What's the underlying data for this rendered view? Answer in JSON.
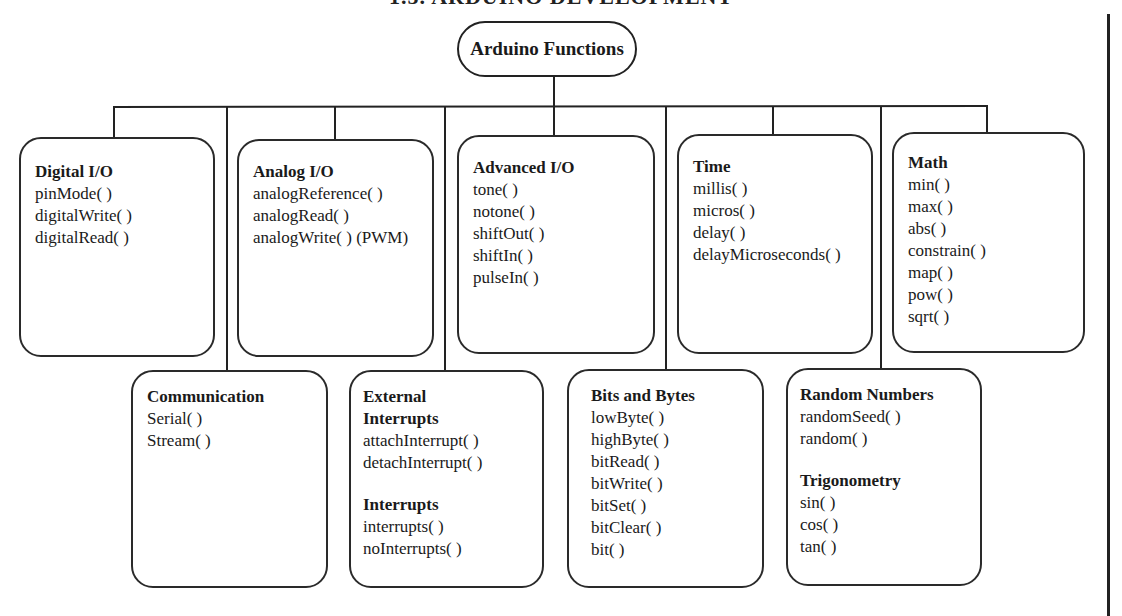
{
  "page": {
    "heading": "1.5. ARDUINO DEVELOPMENT"
  },
  "root": {
    "label": "Arduino Functions"
  },
  "groups": {
    "digital_io": {
      "title": "Digital I/O",
      "functions": [
        "pinMode( )",
        "digitalWrite( )",
        "digitalRead( )"
      ]
    },
    "analog_io": {
      "title": "Analog I/O",
      "functions": [
        "analogReference( )",
        "analogRead( )",
        "analogWrite( ) (PWM)"
      ]
    },
    "advanced_io": {
      "title": "Advanced I/O",
      "functions": [
        "tone( )",
        "notone( )",
        "shiftOut( )",
        "shiftIn( )",
        "pulseIn( )"
      ]
    },
    "time": {
      "title": "Time",
      "functions": [
        "millis( )",
        "micros( )",
        "delay( )",
        "delayMicroseconds( )"
      ]
    },
    "math": {
      "title": "Math",
      "functions": [
        "min( )",
        "max( )",
        "abs( )",
        "constrain( )",
        "map( )",
        "pow( )",
        "sqrt( )"
      ]
    },
    "communication": {
      "title": "Communication",
      "functions": [
        "Serial( )",
        "Stream( )"
      ]
    },
    "external_interrupts": {
      "title_line1": "External",
      "title_line2": "Interrupts",
      "functions": [
        "attachInterrupt( )",
        "detachInterrupt( )"
      ],
      "sub_title": "Interrupts",
      "sub_functions": [
        "interrupts( )",
        "noInterrupts( )"
      ]
    },
    "bits_and_bytes": {
      "title": "Bits and Bytes",
      "functions": [
        "lowByte( )",
        "highByte( )",
        "bitRead( )",
        "bitWrite( )",
        "bitSet( )",
        "bitClear( )",
        "bit( )"
      ]
    },
    "random_numbers": {
      "title": "Random Numbers",
      "functions": [
        "randomSeed( )",
        "random( )"
      ],
      "sub_title": "Trigonometry",
      "sub_functions": [
        "sin( )",
        "cos( )",
        "tan( )"
      ]
    }
  },
  "colors": {
    "line": "#222222",
    "background": "#ffffff",
    "text": "#1a1a1a"
  }
}
